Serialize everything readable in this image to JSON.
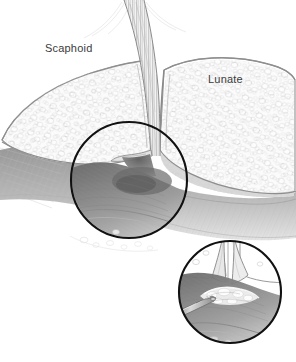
{
  "figure": {
    "medium": "pencil stipple medical illustration",
    "background_color": "#ffffff",
    "width": 296,
    "height": 362
  },
  "labels": [
    {
      "text": "Scaphoid",
      "x": 45,
      "y": 52,
      "color": "#3b3b3b",
      "font_size": 11
    },
    {
      "text": "Lunate",
      "x": 208,
      "y": 83,
      "color": "#3b3b3b",
      "font_size": 11
    }
  ],
  "callouts": {
    "main_circle": {
      "name": "magnification-circle",
      "cx": 129,
      "cy": 180,
      "r": 58,
      "stroke": "#111111",
      "stroke_width": 2.1,
      "depicts": "scapholunate interval with torn interosseous ligament"
    },
    "inset_circle": {
      "name": "detail-inset-circle",
      "cx": 230,
      "cy": 292,
      "r": 52,
      "stroke": "#111111",
      "stroke_width": 2.1,
      "depicts": "close-up of frayed scapholunate ligament probed by surgical instrument"
    }
  },
  "anatomy": {
    "scaphoid": {
      "name": "scaphoid-bone",
      "cortex_color": "#8e8e8e",
      "marrow_color": "#d8d8d8",
      "trabecular_texture": "rounded cancellous blobs"
    },
    "lunate": {
      "name": "lunate-bone",
      "cortex_color": "#8e8e8e",
      "marrow_color": "#d8d8d8",
      "trabecular_texture": "rounded cancellous blobs"
    },
    "ligament": {
      "name": "scapholunate-interosseous-ligament",
      "color": "#9a9a9a",
      "state": "torn"
    },
    "soft_tissue": {
      "name": "soft-tissue-shading",
      "color": "#a8a8a8"
    },
    "instrument": {
      "name": "surgical-probe",
      "color": "#6e6e6e",
      "entry": "lower-left of inset"
    }
  },
  "palette": {
    "ink": "#111111",
    "cortex": "#8e8e8e",
    "marrow": "#d8d8d8",
    "shadow": "#7d7d7d",
    "mid_gray": "#b4b4b4",
    "light_gray": "#e6e6e6",
    "label_gray": "#3b3b3b"
  }
}
